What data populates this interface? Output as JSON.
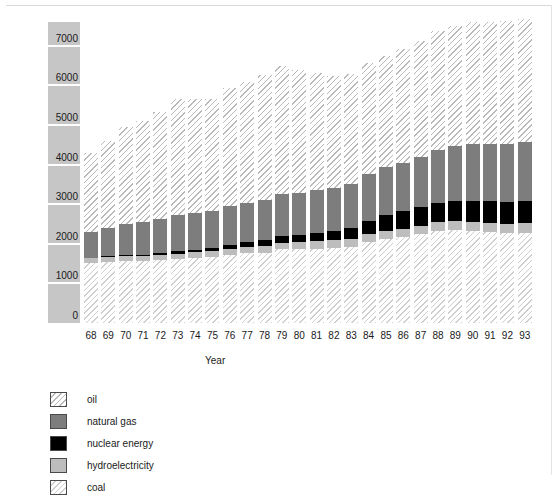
{
  "chart_data": {
    "type": "bar",
    "stacked": true,
    "title": "",
    "xlabel": "Year",
    "ylabel": "Million tonnes oil equivalent",
    "ylim": [
      0,
      7600
    ],
    "yticks": [
      0,
      1000,
      2000,
      3000,
      4000,
      5000,
      6000,
      7000
    ],
    "ytick_labels": [
      "0",
      "1000",
      "2000",
      "3000",
      "4000",
      "5000",
      "6000",
      "7000"
    ],
    "grid": false,
    "legend_position": "below-left",
    "categories": [
      "68",
      "69",
      "70",
      "71",
      "72",
      "73",
      "74",
      "75",
      "76",
      "77",
      "78",
      "79",
      "80",
      "81",
      "82",
      "83",
      "84",
      "85",
      "86",
      "87",
      "88",
      "89",
      "90",
      "91",
      "92",
      "93"
    ],
    "stack_order_bottom_to_top": [
      "coal",
      "hydroelectricity",
      "nuclear energy",
      "natural gas",
      "oil"
    ],
    "series": [
      {
        "name": "coal",
        "color": "#ffffff",
        "pattern": "diagonal-hatch",
        "values": [
          1520,
          1540,
          1560,
          1560,
          1580,
          1620,
          1640,
          1660,
          1720,
          1760,
          1780,
          1860,
          1860,
          1880,
          1900,
          1930,
          2040,
          2120,
          2170,
          2240,
          2320,
          2340,
          2330,
          2300,
          2270,
          2270
        ]
      },
      {
        "name": "hydroelectricity",
        "color": "#bdbdbd",
        "pattern": "solid",
        "values": [
          110,
          115,
          120,
          125,
          130,
          135,
          145,
          150,
          150,
          155,
          160,
          170,
          175,
          180,
          185,
          190,
          200,
          205,
          210,
          215,
          220,
          225,
          230,
          235,
          240,
          245
        ]
      },
      {
        "name": "nuclear energy",
        "color": "#000000",
        "pattern": "solid",
        "values": [
          20,
          25,
          30,
          40,
          50,
          55,
          70,
          95,
          110,
          130,
          150,
          160,
          185,
          225,
          250,
          285,
          345,
          405,
          440,
          465,
          490,
          505,
          520,
          540,
          550,
          560
        ]
      },
      {
        "name": "natural gas",
        "color": "#7d7d7d",
        "pattern": "solid",
        "values": [
          660,
          720,
          790,
          830,
          870,
          920,
          930,
          920,
          970,
          990,
          1020,
          1070,
          1070,
          1080,
          1070,
          1100,
          1180,
          1200,
          1210,
          1280,
          1340,
          1390,
          1430,
          1450,
          1460,
          1490
        ]
      },
      {
        "name": "oil",
        "color": "#ffffff",
        "pattern": "light-diagonal-hatch",
        "values": [
          1990,
          2200,
          2440,
          2550,
          2710,
          2930,
          2870,
          2820,
          2990,
          3050,
          3160,
          3220,
          3100,
          2950,
          2820,
          2790,
          2810,
          2800,
          2890,
          2920,
          3010,
          3050,
          3090,
          3080,
          3100,
          3110
        ]
      }
    ],
    "totals": [
      4300,
      4600,
      4940,
      5105,
      5340,
      5660,
      5655,
      5645,
      5940,
      6085,
      6270,
      6480,
      6390,
      6315,
      6225,
      6295,
      6575,
      6730,
      6920,
      7120,
      7380,
      7510,
      7600,
      7605,
      7620,
      7675
    ]
  },
  "axes": {
    "ylabel": "Million tonnes oil equivalent",
    "xlabel": "Year"
  },
  "legend": {
    "items": [
      {
        "label": "oil",
        "swatch": "light-diagonal-hatch-swatch"
      },
      {
        "label": "natural gas",
        "swatch": "dark-gray-swatch"
      },
      {
        "label": "nuclear energy",
        "swatch": "black-swatch"
      },
      {
        "label": "hydroelectricity",
        "swatch": "light-gray-swatch"
      },
      {
        "label": "coal",
        "swatch": "diagonal-hatch-swatch"
      }
    ]
  }
}
